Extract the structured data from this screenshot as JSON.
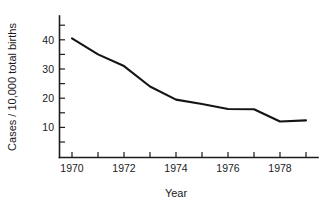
{
  "chart_data": {
    "type": "line",
    "title": "",
    "xlabel": "Year",
    "ylabel": "Cases / 10,000 total births",
    "x": [
      1970,
      1971,
      1972,
      1973,
      1974,
      1975,
      1976,
      1977,
      1978,
      1979
    ],
    "values": [
      40.5,
      35.0,
      31.0,
      24.0,
      19.5,
      18.0,
      16.3,
      16.2,
      12.0,
      12.4
    ],
    "series": [
      {
        "name": "Cases per 10,000 total births",
        "values": [
          40.5,
          35.0,
          31.0,
          24.0,
          19.5,
          18.0,
          16.3,
          16.2,
          12.0,
          12.4
        ]
      }
    ],
    "xlim": [
      1969.4,
      1979.6
    ],
    "ylim": [
      0,
      47
    ],
    "xticks": [
      1970,
      1971,
      1972,
      1973,
      1974,
      1975,
      1976,
      1977,
      1978,
      1979
    ],
    "xtick_labels": [
      "1970",
      "",
      "1972",
      "",
      "1974",
      "",
      "1976",
      "",
      "1978",
      ""
    ],
    "yticks": [
      5,
      10,
      15,
      20,
      25,
      30,
      35,
      40,
      45
    ],
    "ytick_labels": [
      "",
      "10",
      "",
      "20",
      "",
      "30",
      "",
      "40",
      ""
    ],
    "grid": false,
    "legend": false,
    "line_color": "#141414",
    "axis_color": "#1c1c1c"
  },
  "axes": {
    "y_title": "Cases / 10,000 total births",
    "x_title": "Year",
    "y_labels": [
      {
        "text": "40",
        "value": 40
      },
      {
        "text": "30",
        "value": 30
      },
      {
        "text": "20",
        "value": 20
      },
      {
        "text": "10",
        "value": 10
      }
    ],
    "x_labels": [
      {
        "text": "1970",
        "value": 1970
      },
      {
        "text": "1972",
        "value": 1972
      },
      {
        "text": "1974",
        "value": 1974
      },
      {
        "text": "1976",
        "value": 1976
      },
      {
        "text": "1978",
        "value": 1978
      }
    ]
  }
}
